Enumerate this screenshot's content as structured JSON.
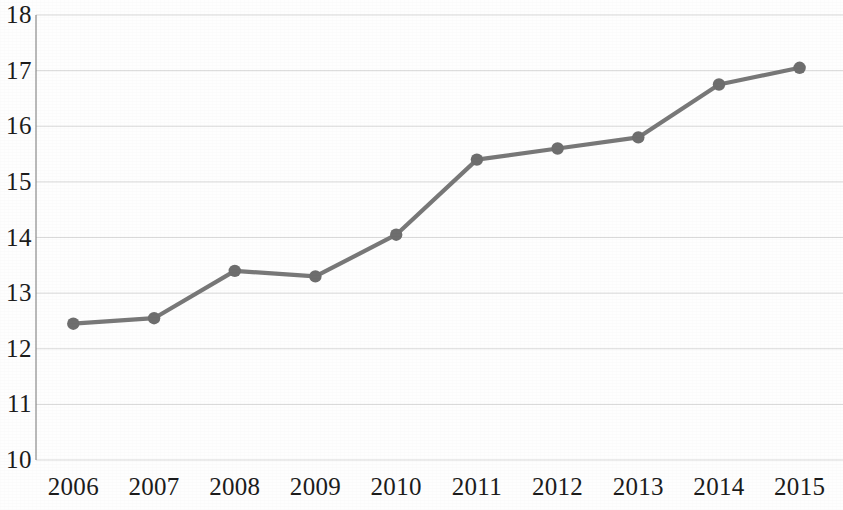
{
  "chart_data": {
    "type": "line",
    "title": "",
    "subtitle": "",
    "xlabel": "",
    "ylabel": "",
    "categories": [
      "2006",
      "2007",
      "2008",
      "2009",
      "2010",
      "2011",
      "2012",
      "2013",
      "2014",
      "2015"
    ],
    "values": [
      12.45,
      12.55,
      13.4,
      13.3,
      14.05,
      15.4,
      15.6,
      15.8,
      16.75,
      17.05
    ],
    "series": [
      {
        "name": "",
        "values": [
          12.45,
          12.55,
          13.4,
          13.3,
          14.05,
          15.4,
          15.6,
          15.8,
          16.75,
          17.05
        ]
      }
    ],
    "ylim": [
      10,
      18
    ],
    "ytick_labels": [
      "18",
      "17",
      "16",
      "15",
      "14",
      "13",
      "12",
      "11",
      "10"
    ],
    "ytick_values": [
      18,
      17,
      16,
      15,
      14,
      13,
      12,
      11,
      10
    ],
    "xtick_labels": [
      "2006",
      "2007",
      "2008",
      "2009",
      "2010",
      "2011",
      "2012",
      "2013",
      "2014",
      "2015"
    ],
    "grid": true,
    "grid_axis": "y",
    "legend": false,
    "legend_position": "none",
    "markers": true,
    "marker_shape": "circle",
    "annotations": []
  },
  "style": {
    "line_color": "#787878",
    "marker_color": "#6e6e6e",
    "grid_color": "#d9d9d9",
    "axis_color": "#8c8c8c",
    "text_color": "#1c1c1c",
    "background": "#fefefe"
  }
}
